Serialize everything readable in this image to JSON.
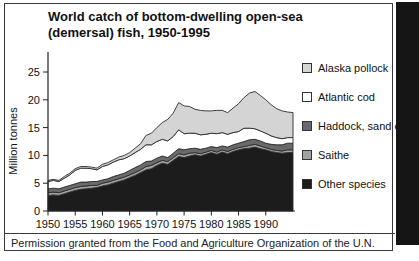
{
  "figure": {
    "title_lines": [
      "World catch of bottom-dwelling open-sea",
      "(demersal) fish, 1950-1995"
    ],
    "caption": "Permission granted from the Food and Agriculture Organization of the U.N."
  },
  "chart_data": {
    "type": "area",
    "stacked": true,
    "title": "World catch of bottom-dwelling open-sea (demersal) fish, 1950-1995",
    "xlabel": "",
    "ylabel": "Million tonnes",
    "xlim": [
      1950,
      1995
    ],
    "ylim": [
      0,
      25
    ],
    "xticks": [
      1950,
      1955,
      1960,
      1965,
      1970,
      1975,
      1980,
      1985,
      1990
    ],
    "yticks": [
      0,
      5,
      10,
      15,
      20,
      25
    ],
    "grid": false,
    "legend_position": "right",
    "outline_color": "#2b2b2b",
    "x": [
      1950,
      1951,
      1952,
      1953,
      1954,
      1955,
      1956,
      1957,
      1958,
      1959,
      1960,
      1961,
      1962,
      1963,
      1964,
      1965,
      1966,
      1967,
      1968,
      1969,
      1970,
      1971,
      1972,
      1973,
      1974,
      1975,
      1976,
      1977,
      1978,
      1979,
      1980,
      1981,
      1982,
      1983,
      1984,
      1985,
      1986,
      1987,
      1988,
      1989,
      1990,
      1991,
      1992,
      1993,
      1994,
      1995
    ],
    "series": [
      {
        "name": "Other species",
        "color": "#1c1c1c",
        "values": [
          2.8,
          2.9,
          2.8,
          3.1,
          3.4,
          3.7,
          3.9,
          4.0,
          4.1,
          4.2,
          4.5,
          4.7,
          5.0,
          5.3,
          5.6,
          6.0,
          6.4,
          6.9,
          7.4,
          7.6,
          8.2,
          8.6,
          8.4,
          9.1,
          9.8,
          9.6,
          9.9,
          10.1,
          9.9,
          10.2,
          10.5,
          10.2,
          10.6,
          10.3,
          10.7,
          11.0,
          11.2,
          11.3,
          11.5,
          11.2,
          11.0,
          10.7,
          10.5,
          10.4,
          10.5,
          10.5
        ]
      },
      {
        "name": "Saithe",
        "color": "#a2a2a2",
        "values": [
          0.5,
          0.5,
          0.5,
          0.5,
          0.5,
          0.5,
          0.5,
          0.5,
          0.5,
          0.4,
          0.5,
          0.5,
          0.5,
          0.5,
          0.5,
          0.5,
          0.5,
          0.5,
          0.6,
          0.6,
          0.5,
          0.5,
          0.5,
          0.5,
          0.5,
          0.5,
          0.5,
          0.4,
          0.4,
          0.4,
          0.4,
          0.4,
          0.4,
          0.4,
          0.4,
          0.4,
          0.4,
          0.5,
          0.5,
          0.5,
          0.4,
          0.4,
          0.4,
          0.4,
          0.5,
          0.5
        ]
      },
      {
        "name": "Haddock, sand eels",
        "color": "#6a6a6a",
        "values": [
          0.7,
          0.7,
          0.7,
          0.7,
          0.7,
          0.7,
          0.8,
          0.7,
          0.7,
          0.7,
          0.6,
          0.6,
          0.7,
          0.7,
          0.7,
          0.8,
          0.9,
          0.9,
          0.9,
          0.8,
          0.8,
          0.8,
          0.7,
          0.8,
          0.9,
          0.9,
          0.8,
          0.8,
          0.8,
          0.7,
          0.7,
          0.8,
          0.7,
          0.8,
          0.8,
          0.8,
          0.9,
          1.0,
          0.9,
          0.9,
          0.8,
          0.9,
          1.0,
          1.1,
          1.2,
          1.2
        ]
      },
      {
        "name": "Atlantic cod",
        "color": "#ffffff",
        "values": [
          1.3,
          1.4,
          1.3,
          1.6,
          1.9,
          2.4,
          2.5,
          2.5,
          2.3,
          2.1,
          2.4,
          2.5,
          2.6,
          2.7,
          2.6,
          2.6,
          2.7,
          2.8,
          3.0,
          2.9,
          3.0,
          3.0,
          3.0,
          3.0,
          3.4,
          2.9,
          2.8,
          2.7,
          2.6,
          2.5,
          2.4,
          2.5,
          2.4,
          2.3,
          2.2,
          2.1,
          2.4,
          2.1,
          1.9,
          1.8,
          1.8,
          1.5,
          1.3,
          1.1,
          1.0,
          1.0
        ]
      },
      {
        "name": "Alaska pollock",
        "color": "#d4d4d4",
        "values": [
          0.2,
          0.2,
          0.2,
          0.3,
          0.3,
          0.3,
          0.3,
          0.3,
          0.3,
          0.3,
          0.4,
          0.4,
          0.4,
          0.5,
          0.6,
          0.6,
          0.8,
          1.0,
          1.7,
          2.1,
          2.5,
          3.0,
          3.9,
          4.2,
          4.9,
          5.0,
          4.8,
          4.3,
          4.4,
          4.2,
          4.0,
          4.2,
          4.0,
          3.9,
          4.4,
          5.0,
          5.5,
          6.3,
          6.7,
          6.4,
          6.0,
          5.6,
          5.2,
          5.0,
          4.6,
          4.5
        ]
      }
    ],
    "legend": [
      {
        "label": "Alaska pollock",
        "color": "#d4d4d4"
      },
      {
        "label": "Atlantic cod",
        "color": "#ffffff"
      },
      {
        "label": "Haddock, sand eels",
        "color": "#6a6a6a"
      },
      {
        "label": "Saithe",
        "color": "#a2a2a2"
      },
      {
        "label": "Other species",
        "color": "#1c1c1c"
      }
    ]
  }
}
